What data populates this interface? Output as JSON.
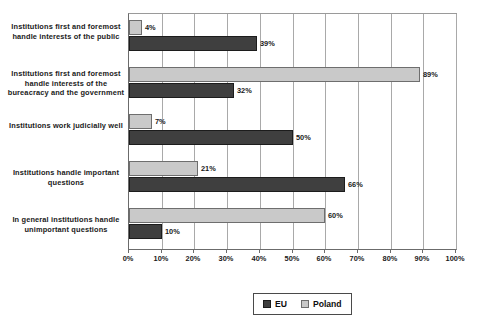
{
  "chart_data": {
    "type": "bar",
    "orientation": "horizontal",
    "title": "",
    "subtitle": "",
    "xlabel": "",
    "ylabel": "",
    "xlim": [
      0,
      100
    ],
    "grid": true,
    "legend_position": "bottom",
    "categories": [
      "Institutions first and foremost handle interests of the public",
      "Institutions first and foremost handle interests of the bureacracy and the government",
      "Institutions work judicially well",
      "Institutions handle important questions",
      "In general institutions handle unimportant questions"
    ],
    "series": [
      {
        "name": "EU",
        "color": "#3f3f3f",
        "values": [
          39,
          32,
          50,
          66,
          10
        ]
      },
      {
        "name": "Poland",
        "color": "#c9c9c9",
        "values": [
          4,
          89,
          7,
          21,
          60
        ]
      }
    ],
    "tick_labels": [
      "0%",
      "10%",
      "20%",
      "30%",
      "40%",
      "50%",
      "60%",
      "70%",
      "80%",
      "90%",
      "100%"
    ],
    "tick_values": [
      0,
      10,
      20,
      30,
      40,
      50,
      60,
      70,
      80,
      90,
      100
    ],
    "data_labels": {
      "EU": [
        "39%",
        "32%",
        "50%",
        "66%",
        "10%"
      ],
      "Poland": [
        "4%",
        "89%",
        "7%",
        "21%",
        "60%"
      ]
    }
  },
  "legend": {
    "entries": [
      {
        "label": "EU"
      },
      {
        "label": "Poland"
      }
    ]
  }
}
